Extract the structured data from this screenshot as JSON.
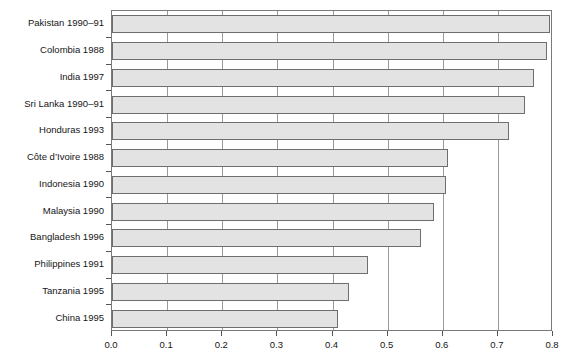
{
  "chart_data": {
    "type": "bar",
    "orientation": "horizontal",
    "title": "",
    "xlabel": "",
    "ylabel": "",
    "xlim": [
      0.0,
      0.8
    ],
    "xticks": [
      "0.0",
      "0.1",
      "0.2",
      "0.3",
      "0.4",
      "0.5",
      "0.6",
      "0.7",
      "0.8"
    ],
    "xtick_values": [
      0.0,
      0.1,
      0.2,
      0.3,
      0.4,
      0.5,
      0.6,
      0.7,
      0.8
    ],
    "grid": true,
    "grid_axis": "x",
    "legend": "none",
    "bar_fill": "#e3e3e3",
    "bar_edge": "#6e6e6e",
    "categories": [
      "Pakistan 1990–91",
      "Colombia 1988",
      "India 1997",
      "Sri Lanka 1990–91",
      "Honduras 1993",
      "Côte d’Ivoire 1988",
      "Indonesia 1990",
      "Malaysia 1990",
      "Bangladesh 1996",
      "Philippines 1991",
      "Tanzania 1995",
      "China 1995"
    ],
    "values": [
      0.795,
      0.79,
      0.765,
      0.75,
      0.72,
      0.61,
      0.605,
      0.585,
      0.56,
      0.465,
      0.43,
      0.41
    ]
  }
}
